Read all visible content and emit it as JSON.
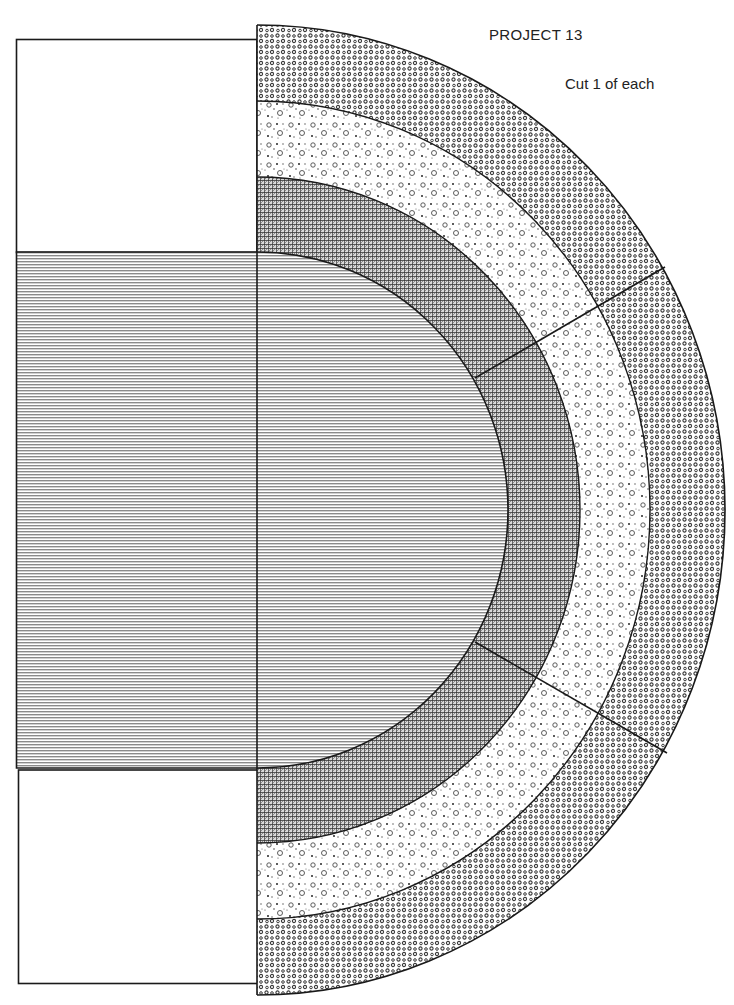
{
  "page": {
    "title": "PROJECT 13",
    "note": "Cut 1 of each"
  },
  "geometry": {
    "center": [
      257,
      510
    ],
    "left_edge_x": 16,
    "top_rect": {
      "y1": 39,
      "y2": 252
    },
    "bottom_rect": {
      "y1": 770,
      "y2": 983
    },
    "rings": [
      {
        "name": "center-piece",
        "fabric": "horizontal-stripes",
        "rx": 251,
        "ry": 258
      },
      {
        "name": "ring-1",
        "fabric": "crosshatch",
        "rx": 323,
        "ry": 333
      },
      {
        "name": "ring-2",
        "fabric": "floral-print",
        "rx": 393,
        "ry": 409
      },
      {
        "name": "ring-3",
        "fabric": "polka-dots",
        "rx": 468,
        "ry": 485
      }
    ],
    "dividers": [
      {
        "from": [
          475,
          378
        ],
        "to": [
          665,
          267
        ]
      },
      {
        "from": [
          475,
          642
        ],
        "to": [
          667,
          753
        ]
      }
    ]
  },
  "pieces": [
    {
      "id": "top-rectangle",
      "fill": "blank"
    },
    {
      "id": "bottom-rectangle",
      "fill": "blank"
    },
    {
      "id": "center-piece",
      "fill": "horizontal-stripes"
    },
    {
      "id": "ring-1-upper",
      "fill": "crosshatch"
    },
    {
      "id": "ring-1-middle",
      "fill": "crosshatch"
    },
    {
      "id": "ring-1-lower",
      "fill": "crosshatch"
    },
    {
      "id": "ring-2-upper",
      "fill": "floral-print"
    },
    {
      "id": "ring-2-middle",
      "fill": "floral-print"
    },
    {
      "id": "ring-2-lower",
      "fill": "floral-print"
    },
    {
      "id": "ring-3-upper",
      "fill": "polka-dots"
    },
    {
      "id": "ring-3-middle",
      "fill": "polka-dots"
    },
    {
      "id": "ring-3-lower",
      "fill": "polka-dots"
    }
  ],
  "colors": {
    "line": "#1a1a1a",
    "stripe": "#8a8a8a",
    "crosshatch": "#333333",
    "dots": "#444444",
    "floral": "#555555",
    "background": "#ffffff"
  }
}
